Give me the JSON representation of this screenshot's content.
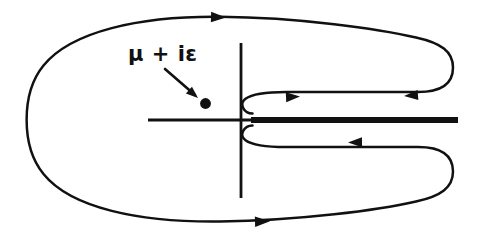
{
  "figure": {
    "background_color": "#ffffff",
    "ink_color": "#111111",
    "width": 492,
    "height": 236
  },
  "annotations": {
    "pole_label": "μ + iε",
    "pole_label_parts": {
      "mu": "μ",
      "plus": "+",
      "i": "i",
      "epsilon": "ε"
    }
  },
  "axes": {
    "origin": {
      "x": 241,
      "y": 120
    },
    "real_axis": {
      "x1": 148,
      "y1": 120,
      "x2": 252,
      "y2": 120,
      "label": ""
    },
    "imaginary_axis": {
      "x1": 241,
      "y1": 43,
      "x2": 241,
      "y2": 198,
      "label": ""
    },
    "stroke_width": 2.6
  },
  "branch_cut": {
    "name": "branch-cut",
    "x1": 252,
    "y1": 120,
    "x2": 458,
    "y2": 120,
    "stroke_width": 6,
    "color": "#111111"
  },
  "pole": {
    "name": "pole-marker",
    "x": 203,
    "y": 103,
    "radius": 5.2,
    "color": "#111111"
  },
  "pointer_arrow": {
    "name": "label-pointer",
    "x1": 166,
    "y1": 70,
    "x2": 197,
    "y2": 97
  },
  "contour": {
    "name": "outer-contour",
    "stroke_width": 2.4,
    "description": "Large closed keyhole contour: outer loop opens on the right into a narrow slit that wraps the branch point at the origin.",
    "path": "M 252.5 113.0 C 244.5 113.0 239.5 104.5 245.5 99.5 C 252 94 266 92 286 92 L 418 92 C 440 92 452 84 452 68 C 452 52 440 44 416 38 C 380 29 300 18 220 17 C 140 16 72 32 44 66 C 22 93 22 147 44 174 C 72 208 140 222 220 221 C 300 220 380 210 416 201 C 440 195 452 187 452 171 C 452 155 440 147 418 147 L 286 147 C 266 147 252 145 245.5 139.5 C 239.5 134.5 244.5 126 252.5 126"
  },
  "arrows": [
    {
      "name": "arrow-outer-top",
      "x": 218,
      "y": 17.5,
      "angle": 0,
      "direction": "right",
      "on": "outer top edge"
    },
    {
      "name": "arrow-outer-bottom",
      "x": 262,
      "y": 221,
      "angle": 0,
      "direction": "right",
      "on": "outer bottom edge"
    },
    {
      "name": "arrow-keyhole-upper",
      "x": 292,
      "y": 98,
      "angle": -4,
      "direction": "right",
      "on": "upper slit edge"
    },
    {
      "name": "arrow-keyhole-upper-right",
      "x": 418,
      "y": 99,
      "angle": 182,
      "direction": "left",
      "on": "upper slit right segment"
    },
    {
      "name": "arrow-keyhole-lower",
      "x": 358,
      "y": 138,
      "angle": 181,
      "direction": "left",
      "on": "lower slit edge"
    }
  ],
  "legend": {
    "visible": false,
    "entries": []
  }
}
